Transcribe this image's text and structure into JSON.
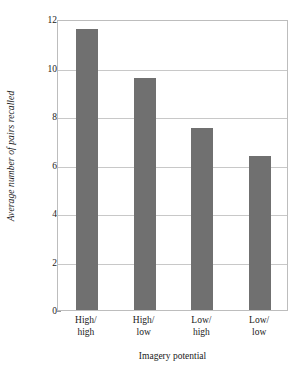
{
  "chart_data": {
    "type": "bar",
    "title": "",
    "subtitle": "",
    "categories": [
      "High/high",
      "High/low",
      "Low/high",
      "Low/low"
    ],
    "category_lines": [
      [
        "High/",
        "high"
      ],
      [
        "High/",
        "low"
      ],
      [
        "Low/",
        "high"
      ],
      [
        "Low/",
        "low"
      ]
    ],
    "values": [
      11.6,
      9.55,
      7.5,
      6.35
    ],
    "xlabel": "Imagery potential",
    "ylabel": "Average number of pairs recalled",
    "ylim": [
      0,
      12
    ],
    "ytick_values": [
      0,
      2,
      4,
      6,
      8,
      10,
      12
    ],
    "ytick_labels": [
      "0",
      "2",
      "4",
      "6",
      "8",
      "10",
      "12"
    ],
    "grid": "horizontal",
    "legend": "none",
    "bar_color": "#707070",
    "grid_color": "#c8c8c8",
    "frame_color": "#bdbdbd",
    "text_color": "#1a1a1a",
    "background": "#ffffff"
  }
}
